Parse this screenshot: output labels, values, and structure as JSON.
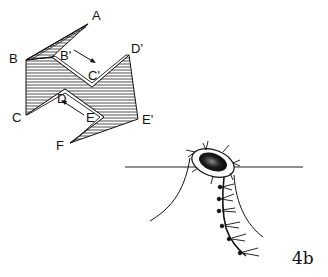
{
  "figure": {
    "panel_label": "4b",
    "fold_diagram": {
      "point_labels": {
        "A": "A",
        "B": "B",
        "B_prime": "B'",
        "C_prime": "C'",
        "D_prime": "D'",
        "C": "C",
        "D": "D",
        "E": "E",
        "E_prime": "E'",
        "F": "F"
      },
      "hatch_color": "#222222"
    },
    "specimen_illustration": {
      "description": "oval body at water line with dangling branched stalk"
    }
  }
}
